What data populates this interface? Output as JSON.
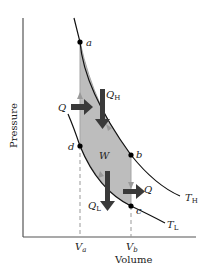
{
  "diagram": {
    "type": "PV diagram - Carnot cycle",
    "axes": {
      "x_label": "Volume",
      "y_label": "Pressure",
      "x_ticks": [
        {
          "main": "V",
          "sub": "a"
        },
        {
          "main": "V",
          "sub": "b"
        }
      ]
    },
    "points": [
      {
        "id": "a",
        "label": "a"
      },
      {
        "id": "b",
        "label": "b"
      },
      {
        "id": "c",
        "label": "c"
      },
      {
        "id": "d",
        "label": "d"
      }
    ],
    "isotherms": [
      {
        "main": "T",
        "sub": "H"
      },
      {
        "main": "T",
        "sub": "L"
      }
    ],
    "heat_labels": {
      "q_in_left": "Q",
      "q_h": {
        "main": "Q",
        "sub": "H"
      },
      "q_l": {
        "main": "Q",
        "sub": "L"
      },
      "q_out_right": "Q"
    },
    "work_label": "W",
    "colors": {
      "cycle_fill": "#bdbdbd",
      "cycle_edge": "#9e9e9e",
      "arrow": "#3a3a3a",
      "curve": "#111111",
      "axis": "#555555",
      "dashed": "#999999"
    }
  }
}
